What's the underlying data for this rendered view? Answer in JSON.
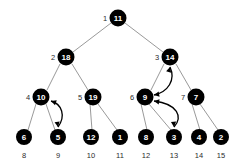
{
  "diagram": {
    "background_color": "#ffffff",
    "node_color": "#000000",
    "node_text_color": "#ffffff",
    "index_text_color": "#2b2b2b",
    "edge_color": "#8d8d8d",
    "arrow_color": "#000000"
  },
  "nodes": [
    {
      "index": "1",
      "value": "11",
      "x": 118,
      "y": 18,
      "r": 8.5,
      "index_dx": -13,
      "index_dy": 0,
      "index_pos": "left"
    },
    {
      "index": "2",
      "value": "18",
      "x": 66,
      "y": 57,
      "r": 8.5,
      "index_dx": -13,
      "index_dy": 0,
      "index_pos": "left"
    },
    {
      "index": "3",
      "value": "14",
      "x": 170,
      "y": 57,
      "r": 8.5,
      "index_dx": -13,
      "index_dy": 0,
      "index_pos": "left"
    },
    {
      "index": "4",
      "value": "10",
      "x": 41,
      "y": 97,
      "r": 8.5,
      "index_dx": -13,
      "index_dy": 0,
      "index_pos": "left"
    },
    {
      "index": "5",
      "value": "19",
      "x": 93,
      "y": 97,
      "r": 8.5,
      "index_dx": -13,
      "index_dy": 0,
      "index_pos": "left"
    },
    {
      "index": "6",
      "value": "9",
      "x": 145,
      "y": 97,
      "r": 8.5,
      "index_dx": -13,
      "index_dy": 0,
      "index_pos": "left"
    },
    {
      "index": "7",
      "value": "7",
      "x": 196,
      "y": 97,
      "r": 8.5,
      "index_dx": -13,
      "index_dy": 0,
      "index_pos": "left"
    },
    {
      "index": "8",
      "value": "6",
      "x": 24,
      "y": 137,
      "r": 8.0,
      "index_dx": 0,
      "index_dy": 18,
      "index_pos": "below"
    },
    {
      "index": "9",
      "value": "5",
      "x": 58,
      "y": 137,
      "r": 8.0,
      "index_dx": 0,
      "index_dy": 18,
      "index_pos": "below"
    },
    {
      "index": "10",
      "value": "12",
      "x": 91,
      "y": 137,
      "r": 8.0,
      "index_dx": 0,
      "index_dy": 18,
      "index_pos": "below"
    },
    {
      "index": "11",
      "value": "1",
      "x": 120,
      "y": 137,
      "r": 8.0,
      "index_dx": 0,
      "index_dy": 18,
      "index_pos": "below"
    },
    {
      "index": "12",
      "value": "8",
      "x": 146,
      "y": 137,
      "r": 8.0,
      "index_dx": 0,
      "index_dy": 18,
      "index_pos": "below"
    },
    {
      "index": "13",
      "value": "3",
      "x": 174,
      "y": 137,
      "r": 8.0,
      "index_dx": 0,
      "index_dy": 18,
      "index_pos": "below"
    },
    {
      "index": "14",
      "value": "4",
      "x": 199,
      "y": 137,
      "r": 8.0,
      "index_dx": 0,
      "index_dy": 18,
      "index_pos": "below"
    },
    {
      "index": "15",
      "value": "2",
      "x": 221,
      "y": 137,
      "r": 8.0,
      "index_dx": 0,
      "index_dy": 18,
      "index_pos": "below"
    }
  ],
  "edges": [
    {
      "from": "1",
      "to": "2",
      "x1": 111,
      "y1": 23,
      "x2": 73,
      "y2": 52
    },
    {
      "from": "1",
      "to": "3",
      "x1": 125,
      "y1": 23,
      "x2": 163,
      "y2": 52
    },
    {
      "from": "2",
      "to": "4",
      "x1": 60,
      "y1": 64,
      "x2": 47,
      "y2": 90
    },
    {
      "from": "2",
      "to": "5",
      "x1": 72,
      "y1": 64,
      "x2": 88,
      "y2": 90
    },
    {
      "from": "3",
      "to": "6",
      "x1": 164,
      "y1": 64,
      "x2": 151,
      "y2": 90
    },
    {
      "from": "3",
      "to": "7",
      "x1": 176,
      "y1": 64,
      "x2": 191,
      "y2": 90
    },
    {
      "from": "4",
      "to": "8",
      "x1": 36,
      "y1": 104,
      "x2": 28,
      "y2": 130
    },
    {
      "from": "4",
      "to": "9",
      "x1": 46,
      "y1": 104,
      "x2": 55,
      "y2": 130
    },
    {
      "from": "5",
      "to": "10",
      "x1": 90,
      "y1": 104,
      "x2": 92,
      "y2": 130
    },
    {
      "from": "5",
      "to": "11",
      "x1": 98,
      "y1": 104,
      "x2": 117,
      "y2": 130
    },
    {
      "from": "6",
      "to": "12",
      "x1": 141,
      "y1": 104,
      "x2": 147,
      "y2": 130
    },
    {
      "from": "6",
      "to": "13",
      "x1": 149,
      "y1": 104,
      "x2": 171,
      "y2": 130
    },
    {
      "from": "7",
      "to": "14",
      "x1": 192,
      "y1": 104,
      "x2": 200,
      "y2": 130
    },
    {
      "from": "7",
      "to": "15",
      "x1": 200,
      "y1": 104,
      "x2": 218,
      "y2": 130
    }
  ],
  "swap_arrows": [
    {
      "name": "swap-10-5",
      "between": [
        "4",
        "9"
      ],
      "path": "M 58 127 C 66 116, 62 104, 51 101",
      "head_a": {
        "x": 51,
        "y": 101,
        "angle": -160
      },
      "head_b": {
        "x": 58,
        "y": 127,
        "angle": 80
      }
    },
    {
      "name": "swap-9-3",
      "between": [
        "6",
        "13"
      ],
      "path": "M 174 127 C 183 117, 178 104, 154 101",
      "head_a": {
        "x": 154,
        "y": 101,
        "angle": -170
      },
      "head_b": {
        "x": 174,
        "y": 127,
        "angle": 85
      }
    },
    {
      "name": "swap-14-9",
      "between": [
        "3",
        "6"
      ],
      "path": "M 154 95 C 168 92, 176 80, 170 67",
      "head_a": {
        "x": 154,
        "y": 95,
        "angle": 170
      },
      "head_b": {
        "x": 170,
        "y": 67,
        "angle": -75
      }
    }
  ],
  "legend": {
    "description": "Binary heap tree with array indices 1-15 labeled beside each node; curved double-headed arrows mark sift-down swaps."
  }
}
